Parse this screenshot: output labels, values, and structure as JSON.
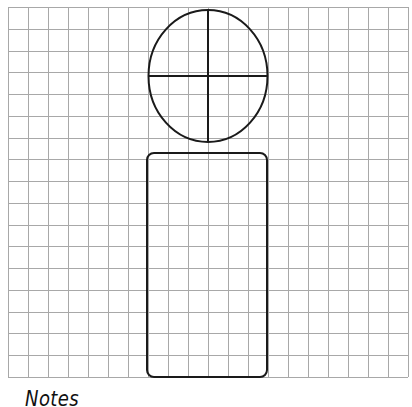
{
  "worksheet": {
    "grid": {
      "left": 8,
      "top": 7,
      "right": 408,
      "bottom": 377,
      "columns": 20,
      "rows": 17,
      "line_color": "#a8a8a8"
    },
    "shapes": {
      "head_circle": {
        "cx": 208,
        "cy": 76,
        "rx": 59.5,
        "ry": 66,
        "stroke": "#1a1a1a"
      },
      "head_horizontal_line": {
        "x1": 148,
        "y1": 76,
        "x2": 267,
        "y2": 76
      },
      "head_vertical_line": {
        "x1": 208,
        "y1": 10,
        "x2": 208,
        "y2": 142
      },
      "body_rectangle": {
        "x": 147,
        "y": 153,
        "width": 120,
        "height": 224,
        "radius": 7,
        "stroke": "#1a1a1a"
      }
    },
    "notes_label": "Notes"
  }
}
